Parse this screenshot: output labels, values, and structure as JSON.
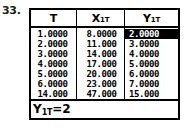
{
  "figure": {
    "problem_number": "33."
  },
  "screen": {
    "table": {
      "columns": [
        {
          "key": "t",
          "base": "T",
          "sub1": "",
          "sub2": "",
          "label": "T"
        },
        {
          "key": "x1t",
          "base": "X",
          "sub1": "1",
          "sub2": "T",
          "label": "X1T"
        },
        {
          "key": "y1t",
          "base": "Y",
          "sub1": "1",
          "sub2": "T",
          "label": "Y1T"
        }
      ],
      "rows": [
        {
          "t": "1.0000",
          "x1t": "8.0000",
          "y1t": "2.0000"
        },
        {
          "t": "2.0000",
          "x1t": "11.000",
          "y1t": "3.0000"
        },
        {
          "t": "3.0000",
          "x1t": "14.000",
          "y1t": "4.0000"
        },
        {
          "t": "4.0000",
          "x1t": "17.000",
          "y1t": "5.0000"
        },
        {
          "t": "5.0000",
          "x1t": "20.000",
          "y1t": "6.0000"
        },
        {
          "t": "6.0000",
          "x1t": "23.000",
          "y1t": "7.0000"
        },
        {
          "t": "14.000",
          "x1t": "47.000",
          "y1t": "15.000"
        }
      ],
      "selected_cell": {
        "row": 0,
        "column": "y1t",
        "value": "2.0000"
      }
    },
    "status": {
      "variable_base": "Y",
      "variable_sub1": "1",
      "variable_sub2": "T",
      "equals": "=",
      "value": "2",
      "text": "Y1T=2"
    }
  },
  "colors": {
    "ink": "#000000",
    "paper": "#ffffff",
    "highlight_bg": "#000000",
    "highlight_fg": "#ffffff"
  }
}
